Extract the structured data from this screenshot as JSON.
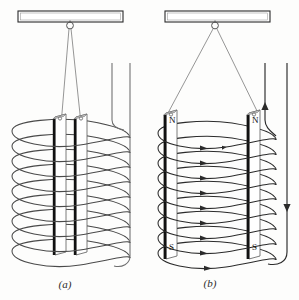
{
  "figure": {
    "type": "physics-diagram",
    "background_color": "#fdfdfc",
    "ink_color": "#2b2b2b",
    "dark_edge_color": "#111111",
    "panels": [
      {
        "id": "a",
        "caption": "(a)",
        "description": "Two bar magnets hang close together side by side inside a tightly wound helical coil",
        "suspension": "narrow V of two threads from a ring on the overhead support",
        "magnet_count": 2,
        "magnets_touching": true,
        "pole_labels": [],
        "coil_turns": 9,
        "coil_has_current_arrows": false,
        "lead_wires": 2,
        "lead_arrow_directions": []
      },
      {
        "id": "b",
        "caption": "(b)",
        "description": "Two bar magnets hang far apart inside the coil, repelled, with current arrows on every turn",
        "suspension": "wide V of two threads from a ring on the overhead support",
        "magnet_count": 2,
        "magnets_touching": false,
        "pole_labels": [
          "N",
          "N",
          "S",
          "S"
        ],
        "north_label": "N",
        "south_label": "S",
        "coil_turns": 9,
        "coil_has_current_arrows": true,
        "lead_wires": 2,
        "lead_arrow_directions": [
          "up",
          "down"
        ]
      }
    ],
    "support_bar": {
      "name": "overhead support bar",
      "fill": "#ffffff",
      "stroke": "#2b2b2b"
    },
    "hook": {
      "name": "suspension ring",
      "shape": "small open circle"
    }
  }
}
